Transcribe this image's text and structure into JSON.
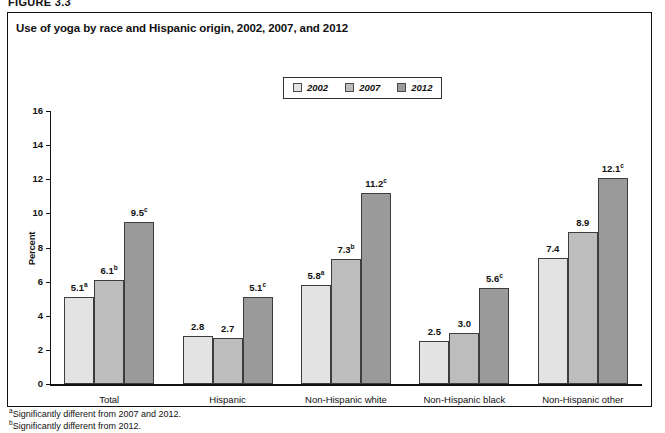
{
  "figure_kicker": "FIGURE 3.3",
  "figure_title": "Use of yoga by race and Hispanic origin, 2002, 2007, and 2012",
  "legend": {
    "items": [
      {
        "label": "2002",
        "color": "#e3e3e3"
      },
      {
        "label": "2007",
        "color": "#bdbdbd"
      },
      {
        "label": "2012",
        "color": "#9a9a9a"
      }
    ]
  },
  "footnotes": [
    {
      "marker": "a",
      "text": "Significantly different from 2007 and 2012."
    },
    {
      "marker": "b",
      "text": "Significantly different from 2012."
    }
  ],
  "chart_data": {
    "type": "bar",
    "title": "Use of yoga by race and Hispanic origin, 2002, 2007, and 2012",
    "xlabel": "",
    "ylabel": "Percent",
    "ylim": [
      0,
      16
    ],
    "yticks": [
      0,
      2,
      4,
      6,
      8,
      10,
      12,
      14,
      16
    ],
    "grid": false,
    "legend_position": "top-center",
    "categories": [
      "Total",
      "Hispanic",
      "Non-Hispanic white",
      "Non-Hispanic black",
      "Non-Hispanic other"
    ],
    "series": [
      {
        "name": "2002",
        "color": "#e3e3e3",
        "values": [
          5.1,
          2.8,
          5.8,
          2.5,
          7.4
        ],
        "labels": [
          "5.1",
          "2.8",
          "5.8",
          "2.5",
          "7.4"
        ],
        "markers": [
          "a",
          "",
          "a",
          "",
          ""
        ]
      },
      {
        "name": "2007",
        "color": "#bdbdbd",
        "values": [
          6.1,
          2.7,
          7.3,
          3.0,
          8.9
        ],
        "labels": [
          "6.1",
          "2.7",
          "7.3",
          "3.0",
          "8.9"
        ],
        "markers": [
          "b",
          "",
          "b",
          "",
          ""
        ]
      },
      {
        "name": "2012",
        "color": "#9a9a9a",
        "values": [
          9.5,
          5.1,
          11.2,
          5.6,
          12.1
        ],
        "labels": [
          "9.5",
          "5.1",
          "11.2",
          "5.6",
          "12.1"
        ],
        "markers": [
          "c",
          "c",
          "c",
          "c",
          "c"
        ]
      }
    ]
  }
}
